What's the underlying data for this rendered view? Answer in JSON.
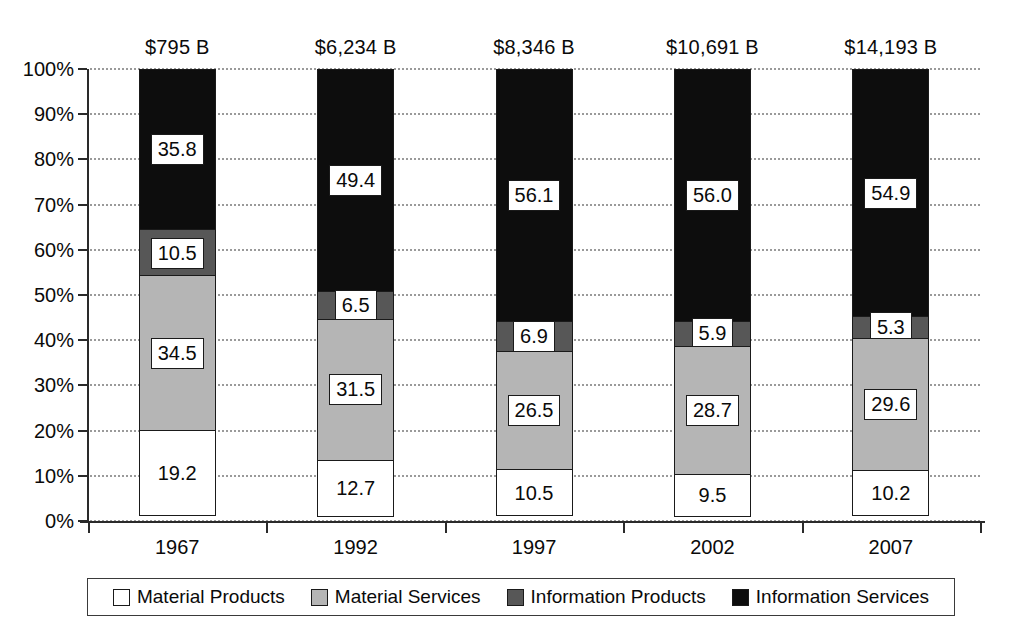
{
  "chart_data": {
    "type": "bar",
    "subtype": "stacked-percentage-column",
    "title": "",
    "subtitle": "",
    "xlabel": "",
    "ylabel": "",
    "categories": [
      "1967",
      "1992",
      "1997",
      "2002",
      "2007"
    ],
    "series": [
      {
        "name": "Material Products",
        "values": [
          19.2,
          12.7,
          10.5,
          9.5,
          10.2
        ],
        "color": "#ffffff"
      },
      {
        "name": "Material Services",
        "values": [
          34.5,
          31.5,
          26.5,
          28.7,
          29.6
        ],
        "color": "#b5b5b5"
      },
      {
        "name": "Information Products",
        "values": [
          10.5,
          6.5,
          6.9,
          5.9,
          5.3
        ],
        "color": "#575757"
      },
      {
        "name": "Information Services",
        "values": [
          35.8,
          49.4,
          56.1,
          56.0,
          54.9
        ],
        "color": "#0d0d0d"
      }
    ],
    "column_totals": [
      "$795 B",
      "$6,234 B",
      "$8,346 B",
      "$10,691 B",
      "$14,193 B"
    ],
    "ylim": [
      0,
      100
    ],
    "ytick_labels": [
      "0%",
      "10%",
      "20%",
      "30%",
      "40%",
      "50%",
      "60%",
      "70%",
      "80%",
      "90%",
      "100%"
    ],
    "ytick_values": [
      0,
      10,
      20,
      30,
      40,
      50,
      60,
      70,
      80,
      90,
      100
    ],
    "grid": true,
    "grid_style": "dotted-horizontal",
    "legend_position": "bottom"
  },
  "legend": {
    "items": [
      {
        "label": "Material Products",
        "swatch_name": "legend-swatch-material-products",
        "color": "#ffffff"
      },
      {
        "label": "Material Services",
        "swatch_name": "legend-swatch-material-services",
        "color": "#b5b5b5"
      },
      {
        "label": "Information Products",
        "swatch_name": "legend-swatch-information-products",
        "color": "#575757"
      },
      {
        "label": "Information Services",
        "swatch_name": "legend-swatch-information-services",
        "color": "#0d0d0d"
      }
    ]
  }
}
